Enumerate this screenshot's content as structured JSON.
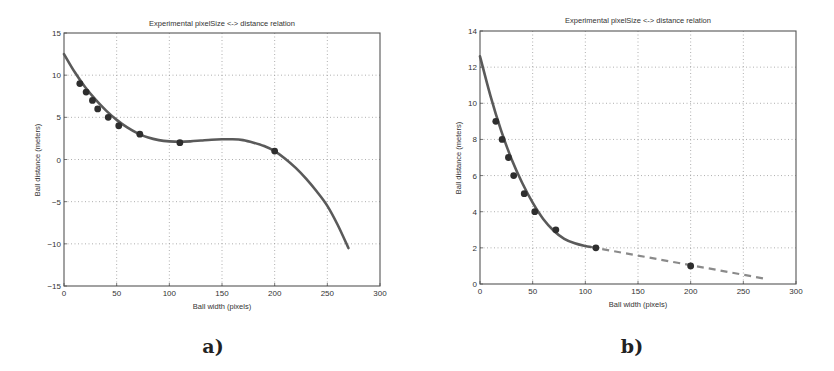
{
  "chart_data": [
    {
      "id": "a",
      "type": "scatter",
      "caption": "a)",
      "title": "Experimental pixelSize <-> distance relation",
      "xlabel": "Ball width (pixels)",
      "ylabel": "Ball distance (meters)",
      "xlim": [
        0,
        300
      ],
      "ylim": [
        -15,
        15
      ],
      "xticks": [
        0,
        50,
        100,
        150,
        200,
        250,
        300
      ],
      "yticks": [
        -15,
        -10,
        -5,
        0,
        5,
        10,
        15
      ],
      "grid": true,
      "series": [
        {
          "name": "measurements",
          "style": "markers",
          "x": [
            15,
            21,
            27,
            32,
            42,
            52,
            72,
            110,
            200
          ],
          "y": [
            9,
            8,
            7,
            6,
            5,
            4,
            3,
            2,
            1
          ]
        },
        {
          "name": "polynomial fit",
          "style": "solid line",
          "x": [
            0,
            10,
            20,
            30,
            40,
            50,
            60,
            70,
            80,
            90,
            100,
            110,
            120,
            130,
            140,
            150,
            160,
            170,
            180,
            190,
            200,
            210,
            220,
            230,
            240,
            250,
            260,
            270
          ],
          "y": [
            12.5,
            10.4,
            8.6,
            7.1,
            5.8,
            4.7,
            3.8,
            3.1,
            2.6,
            2.3,
            2.15,
            2.1,
            2.15,
            2.25,
            2.35,
            2.4,
            2.4,
            2.3,
            2.0,
            1.6,
            1.0,
            0.1,
            -1.0,
            -2.3,
            -3.8,
            -5.5,
            -7.8,
            -10.5
          ]
        }
      ]
    },
    {
      "id": "b",
      "type": "scatter",
      "caption": "b)",
      "title": "Experimental pixelSize <-> distance relation",
      "xlabel": "Ball width (pixels)",
      "ylabel": "Ball distance (meters)",
      "xlim": [
        0,
        300
      ],
      "ylim": [
        0,
        14
      ],
      "xticks": [
        0,
        50,
        100,
        150,
        200,
        250,
        300
      ],
      "yticks": [
        0,
        2,
        4,
        6,
        8,
        10,
        12,
        14
      ],
      "grid": true,
      "series": [
        {
          "name": "measurements",
          "style": "markers",
          "x": [
            15,
            21,
            27,
            32,
            42,
            52,
            72,
            110,
            200
          ],
          "y": [
            9,
            8,
            7,
            6,
            5,
            4,
            3,
            2,
            1
          ]
        },
        {
          "name": "polynomial fit",
          "style": "solid line",
          "x": [
            0,
            10,
            20,
            30,
            40,
            50,
            60,
            70,
            80,
            90,
            100,
            105
          ],
          "y": [
            12.6,
            10.4,
            8.5,
            6.9,
            5.6,
            4.5,
            3.6,
            2.95,
            2.5,
            2.25,
            2.1,
            2.05
          ]
        },
        {
          "name": "linear extrapolation",
          "style": "dashed line",
          "x": [
            105,
            270
          ],
          "y": [
            2.05,
            0.3
          ]
        }
      ]
    }
  ]
}
